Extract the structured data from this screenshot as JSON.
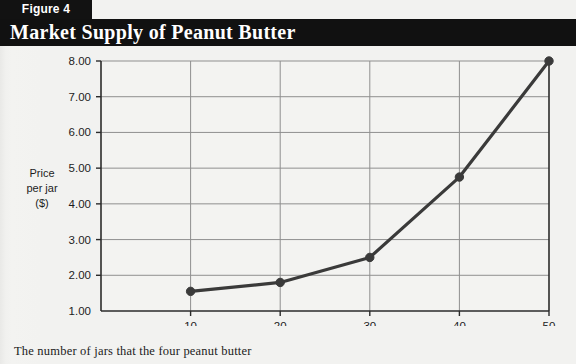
{
  "figure": {
    "tab_label": "Figure 4",
    "title": "Market Supply of Peanut Butter",
    "caption": "The number of jars that the four peanut butter"
  },
  "colors": {
    "header_black": "#111111",
    "page_background": "#f2f2f0",
    "plot_background": "#f3f3f1",
    "gridline": "#8f8f8f",
    "axis": "#2b2b2b",
    "series_line": "#3a3a3a",
    "marker": "#3a3a3a",
    "title_text": "#ffffff",
    "label_text": "#1d1d1d"
  },
  "chart_data": {
    "type": "line",
    "title": "Market Supply of Peanut Butter",
    "xlabel": "Quantity (thousands of jars per month)",
    "ylabel": "Price per jar ($)",
    "ylabel_lines": [
      "Price",
      "per jar",
      "($)"
    ],
    "x": [
      10,
      20,
      30,
      40,
      50
    ],
    "values": [
      1.55,
      1.8,
      2.5,
      4.75,
      8.0
    ],
    "series": [
      {
        "name": "Market supply",
        "values": [
          1.55,
          1.8,
          2.5,
          4.75,
          8.0
        ]
      }
    ],
    "xlim": [
      0,
      50
    ],
    "ylim": [
      1.0,
      8.0
    ],
    "xticks": [
      10,
      20,
      30,
      40,
      50
    ],
    "xtick_labels": [
      "10",
      "20",
      "30",
      "40",
      "50"
    ],
    "yticks": [
      1.0,
      2.0,
      3.0,
      4.0,
      5.0,
      6.0,
      7.0,
      8.0
    ],
    "ytick_labels": [
      "1.00",
      "2.00",
      "3.00",
      "4.00",
      "5.00",
      "6.00",
      "7.00",
      "8.00"
    ],
    "grid": true,
    "grid_axis": "both",
    "legend": false,
    "markers": "circle"
  }
}
